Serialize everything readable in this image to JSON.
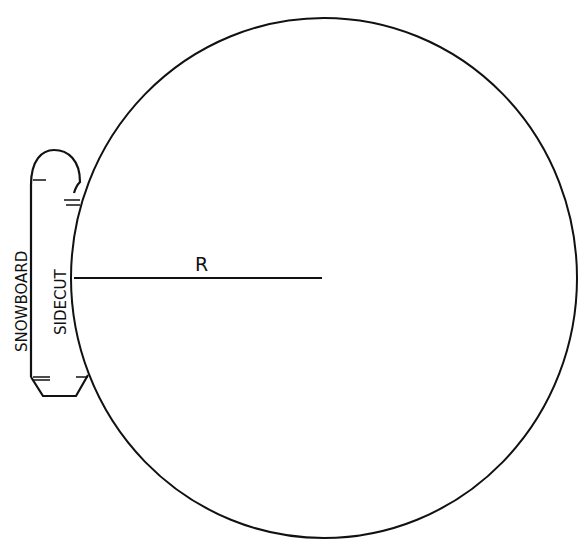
{
  "diagram": {
    "title": "",
    "labels": {
      "radius": "R",
      "board": "SNOWBOARD",
      "sidecut": "SIDECUT"
    },
    "colors": {
      "stroke": "#111111",
      "background": "#ffffff"
    },
    "shapes": {
      "circle": {
        "cx": 324,
        "cy": 278,
        "rx": 253,
        "ry": 260
      },
      "radius_line": {
        "x1": 74,
        "y1": 278,
        "x2": 322,
        "y2": 278
      }
    }
  }
}
